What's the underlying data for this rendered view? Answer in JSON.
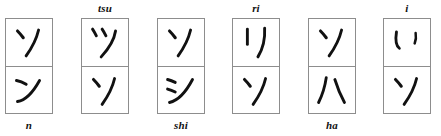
{
  "figure": {
    "box_count": 6,
    "stroke_color": "#111111",
    "border_color": "#8d8d8d",
    "background_color": "#ffffff"
  },
  "boxes": [
    {
      "id": "box-1",
      "x": 5,
      "label": "n",
      "label_position": "below",
      "top_cell": {
        "kana": "ソ",
        "romaji": "so",
        "script": "katakana"
      },
      "bottom_cell": {
        "kana": "ン",
        "romaji": "n",
        "script": "katakana"
      }
    },
    {
      "id": "box-2",
      "x": 81,
      "label": "tsu",
      "label_position": "above",
      "top_cell": {
        "kana": "ツ",
        "romaji": "tsu",
        "script": "katakana"
      },
      "bottom_cell": {
        "kana": "ソ",
        "romaji": "so",
        "script": "katakana"
      }
    },
    {
      "id": "box-3",
      "x": 157,
      "label": "shi",
      "label_position": "below",
      "top_cell": {
        "kana": "ソ",
        "romaji": "so",
        "script": "katakana"
      },
      "bottom_cell": {
        "kana": "シ",
        "romaji": "shi",
        "script": "katakana"
      }
    },
    {
      "id": "box-4",
      "x": 232,
      "label": "ri",
      "label_position": "above",
      "top_cell": {
        "kana": "リ",
        "romaji": "ri",
        "script": "katakana"
      },
      "bottom_cell": {
        "kana": "ソ",
        "romaji": "so",
        "script": "katakana"
      }
    },
    {
      "id": "box-5",
      "x": 308,
      "label": "ha",
      "label_position": "below",
      "top_cell": {
        "kana": "ソ",
        "romaji": "so",
        "script": "katakana"
      },
      "bottom_cell": {
        "kana": "ハ",
        "romaji": "ha",
        "script": "katakana"
      }
    },
    {
      "id": "box-6",
      "x": 383,
      "label": "i",
      "label_position": "above",
      "top_cell": {
        "kana": "い",
        "romaji": "i",
        "script": "hiragana"
      },
      "bottom_cell": {
        "kana": "ソ",
        "romaji": "so",
        "script": "katakana"
      }
    }
  ]
}
